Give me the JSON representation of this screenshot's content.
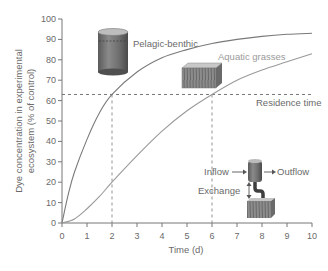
{
  "chart_data": {
    "type": "line",
    "title": "",
    "xlabel": "Time (d)",
    "ylabel_line1": "Dye concentration in experimental",
    "ylabel_line2": "ecosystem (% of control)",
    "xlim": [
      0,
      10
    ],
    "ylim": [
      0,
      100
    ],
    "x_ticks": [
      "0",
      "1",
      "2",
      "3",
      "4",
      "5",
      "6",
      "7",
      "8",
      "9",
      "10"
    ],
    "y_ticks": [
      "0",
      "10",
      "20",
      "30",
      "40",
      "50",
      "60",
      "70",
      "80",
      "90",
      "100"
    ],
    "grid": false,
    "series": [
      {
        "name": "Pelagic-benthic",
        "color": "#7a7a7a",
        "x": [
          0,
          0.25,
          0.5,
          1,
          1.5,
          2,
          3,
          4,
          5,
          6,
          7,
          8,
          9,
          10
        ],
        "values": [
          0,
          14,
          25,
          41,
          54,
          63,
          74,
          81,
          85,
          88,
          90,
          91.5,
          92.5,
          93
        ]
      },
      {
        "name": "Aquatic grasses",
        "color": "#9a9a9a",
        "x": [
          0,
          0.5,
          1,
          1.5,
          2,
          3,
          4,
          5,
          6,
          7,
          8,
          9,
          10
        ],
        "values": [
          0,
          2,
          7,
          13,
          20,
          33,
          45,
          55,
          63,
          70,
          75,
          79,
          83
        ]
      }
    ],
    "reference_lines": {
      "residence_time_y": 63,
      "residence_time_label": "Residence time",
      "vertical_x": [
        2,
        6
      ]
    },
    "annotations": {
      "pelagic_label": "Pelagic-benthic",
      "grasses_label": "Aquatic grasses",
      "inflow_label": "Inflow",
      "outflow_label": "Outflow",
      "exchange_label": "Exchange"
    }
  }
}
